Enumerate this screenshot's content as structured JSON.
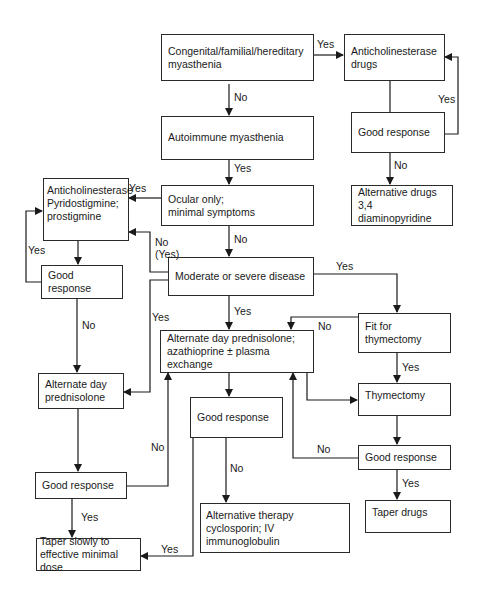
{
  "nodes": {
    "congenital": "Congenital/familial/hereditary\nmyasthenia",
    "antichol_drugs": "Anticholinesterase\ndrugs",
    "autoimmune": "Autoimmune myasthenia",
    "good_response_tr": "Good response",
    "alternative_drugs": "Alternative drugs\n3,4 diaminopyridine",
    "ocular": "Ocular only;\nminimal symptoms",
    "antichol_pyrido": "Anticholinesterase\nPyridostigmine;\nprostigmine",
    "good_response_l1": "Good response",
    "moderate_severe": "Moderate or severe disease",
    "alt_day_pred_left": "Alternate day\nprednisolone",
    "alt_day_pred_aza": "Alternate day prednisolone;\nazathioprine ±  plasma\nexchange",
    "fit_thymectomy": "Fit for thymectomy",
    "thymectomy": "Thymectomy",
    "good_response_center": "Good response",
    "good_response_l2": "Good response",
    "good_response_r": "Good response",
    "taper_drugs": "Taper drugs",
    "alternative_therapy": "Alternative therapy\ncyclosporin; IV immunoglobulin",
    "taper_slowly": "Taper slowly to\neffective minimal dose"
  },
  "edge_labels": {
    "congenital_yes": "Yes",
    "congenital_no": "No",
    "good_tr_yes": "Yes",
    "good_tr_no": "No",
    "autoimmune_yes": "Yes",
    "ocular_yes": "Yes",
    "ocular_no": "No",
    "moderate_no_yes": "No\n(Yes)",
    "good_l1_yes": "Yes",
    "good_l1_no": "No",
    "moderate_yes_left": "Yes",
    "moderate_yes_down": "Yes",
    "moderate_yes_right": "Yes",
    "fit_no": "No",
    "fit_yes": "Yes",
    "good_center_no": "No",
    "good_center_yes": "Yes",
    "good_l2_no": "No",
    "good_l2_yes": "Yes",
    "good_r_no": "No",
    "good_r_yes": "Yes"
  }
}
